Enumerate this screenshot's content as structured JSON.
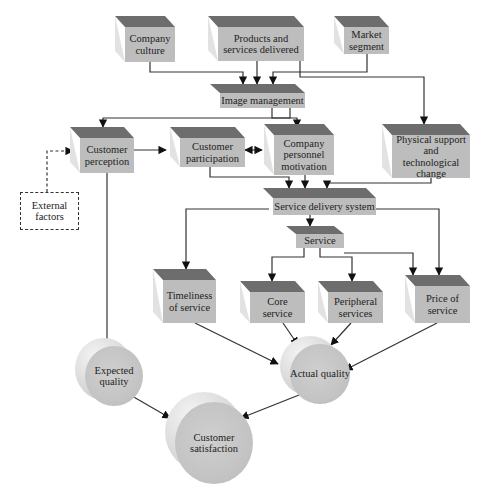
{
  "diagram": {
    "nodes": {
      "company_culture": "Company culture",
      "products_services": "Products and services delivered",
      "market_segment": "Market segment",
      "image_management": "Image management",
      "customer_perception": "Customer perception",
      "customer_participation": "Customer participation",
      "personnel_motivation": "Company personnel motivation",
      "physical_support": "Physical support and technological change",
      "external_factors": "External factors",
      "service_delivery": "Service delivery system",
      "service": "Service",
      "timeliness": "Timeliness of service",
      "core_service": "Core service",
      "peripheral_services": "Peripheral services",
      "price": "Price of service",
      "expected_quality": "Expected quality",
      "actual_quality": "Actual quality",
      "customer_satisfaction": "Customer satisfaction"
    },
    "edges": [
      [
        "Company culture",
        "Image management"
      ],
      [
        "Products and services delivered",
        "Image management"
      ],
      [
        "Market segment",
        "Image management"
      ],
      [
        "Products and services delivered",
        "Physical support and technological change"
      ],
      [
        "Image management",
        "Customer perception"
      ],
      [
        "Image management",
        "Company personnel motivation"
      ],
      [
        "External factors",
        "Customer perception"
      ],
      [
        "Customer perception",
        "Customer participation"
      ],
      [
        "Customer participation",
        "Company personnel motivation"
      ],
      [
        "Company personnel motivation",
        "Customer participation"
      ],
      [
        "Customer participation",
        "Service delivery system"
      ],
      [
        "Company personnel motivation",
        "Service delivery system"
      ],
      [
        "Physical support and technological change",
        "Service delivery system"
      ],
      [
        "Service delivery system",
        "Service"
      ],
      [
        "Service delivery system",
        "Timeliness of service"
      ],
      [
        "Service delivery system",
        "Price of service"
      ],
      [
        "Service",
        "Core service"
      ],
      [
        "Service",
        "Peripheral services"
      ],
      [
        "Service",
        "Price of service"
      ],
      [
        "Customer perception",
        "Expected quality"
      ],
      [
        "Timeliness of service",
        "Actual quality"
      ],
      [
        "Core service",
        "Actual quality"
      ],
      [
        "Peripheral services",
        "Actual quality"
      ],
      [
        "Price of service",
        "Actual quality"
      ],
      [
        "Expected quality",
        "Customer satisfaction"
      ],
      [
        "Actual quality",
        "Customer satisfaction"
      ]
    ]
  }
}
